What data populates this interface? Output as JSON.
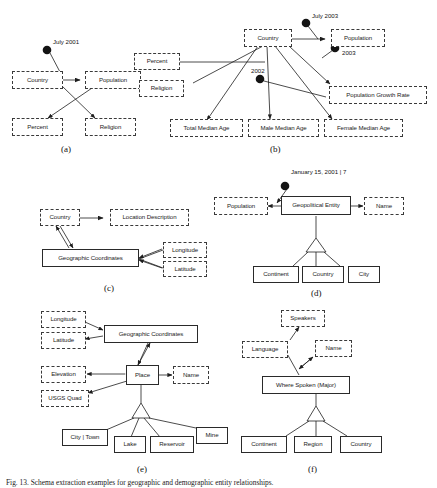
{
  "figure": {
    "caption": "Fig. 13. Schema extraction examples for geographic and demographic entity relationships.",
    "panels": [
      {
        "id": "a",
        "label": "(a)",
        "nodes": [
          {
            "name": "country",
            "text": "Country",
            "style": "dashed"
          },
          {
            "name": "population",
            "text": "Population",
            "style": "dashed"
          },
          {
            "name": "percent",
            "text": "Percent",
            "style": "dashed"
          },
          {
            "name": "religion",
            "text": "Religion",
            "style": "dashed"
          }
        ],
        "annotations": [
          {
            "name": "july-2001",
            "text": "July 2001"
          }
        ]
      },
      {
        "id": "b",
        "label": "(b)",
        "nodes": [
          {
            "name": "country",
            "text": "Country",
            "style": "dashed"
          },
          {
            "name": "population",
            "text": "Population",
            "style": "dashed"
          },
          {
            "name": "percent",
            "text": "Percent",
            "style": "dashed"
          },
          {
            "name": "religion",
            "text": "Religion",
            "style": "dashed"
          },
          {
            "name": "population-growth-rate",
            "text": "Population Growth Rate",
            "style": "dashed"
          },
          {
            "name": "total-median-age",
            "text": "Total Median Age",
            "style": "dashed"
          },
          {
            "name": "male-median-age",
            "text": "Male Median Age",
            "style": "dashed"
          },
          {
            "name": "female-median-age",
            "text": "Female Median Age",
            "style": "dashed"
          }
        ],
        "annotations": [
          {
            "name": "july-2003",
            "text": "July 2003"
          },
          {
            "name": "year-2003",
            "text": "2003"
          },
          {
            "name": "year-2002",
            "text": "2002"
          }
        ]
      },
      {
        "id": "c",
        "label": "(c)",
        "nodes": [
          {
            "name": "country",
            "text": "Country",
            "style": "dashed"
          },
          {
            "name": "location-description",
            "text": "Location Description",
            "style": "dashed"
          },
          {
            "name": "geographic-coordinates",
            "text": "Geographic Coordinates",
            "style": "solid"
          },
          {
            "name": "longitude",
            "text": "Longitude",
            "style": "dashed"
          },
          {
            "name": "latitude",
            "text": "Latitude",
            "style": "dashed"
          }
        ],
        "annotations": []
      },
      {
        "id": "d",
        "label": "(d)",
        "nodes": [
          {
            "name": "population",
            "text": "Population",
            "style": "dashed"
          },
          {
            "name": "geopolitical-entity",
            "text": "Geopolitical Entity",
            "style": "solid"
          },
          {
            "name": "name",
            "text": "Name",
            "style": "dashed"
          },
          {
            "name": "continent",
            "text": "Continent",
            "style": "solid"
          },
          {
            "name": "country",
            "text": "Country",
            "style": "solid"
          },
          {
            "name": "city",
            "text": "City",
            "style": "solid"
          }
        ],
        "annotations": [
          {
            "name": "january-15-2001",
            "text": "January 15, 2001 | 7"
          }
        ]
      },
      {
        "id": "e",
        "label": "(e)",
        "nodes": [
          {
            "name": "longitude",
            "text": "Longitude",
            "style": "dashed"
          },
          {
            "name": "latitude",
            "text": "Latitude",
            "style": "dashed"
          },
          {
            "name": "elevation",
            "text": "Elevation",
            "style": "dashed"
          },
          {
            "name": "usgs-quad",
            "text": "USGS Quad",
            "style": "dashed"
          },
          {
            "name": "geographic-coordinates",
            "text": "Geographic Coordinates",
            "style": "solid"
          },
          {
            "name": "place",
            "text": "Place",
            "style": "solid"
          },
          {
            "name": "name",
            "text": "Name",
            "style": "dashed"
          },
          {
            "name": "city-town",
            "text": "City | Town",
            "style": "solid"
          },
          {
            "name": "lake",
            "text": "Lake",
            "style": "solid"
          },
          {
            "name": "reservoir",
            "text": "Reservoir",
            "style": "solid"
          },
          {
            "name": "mine",
            "text": "Mine",
            "style": "solid"
          }
        ],
        "annotations": []
      },
      {
        "id": "f",
        "label": "(f)",
        "nodes": [
          {
            "name": "speakers",
            "text": "Speakers",
            "style": "dashed"
          },
          {
            "name": "language",
            "text": "Language",
            "style": "dashed"
          },
          {
            "name": "name",
            "text": "Name",
            "style": "dashed"
          },
          {
            "name": "where-spoken-major",
            "text": "Where Spoken (Major)",
            "style": "solid"
          },
          {
            "name": "continent",
            "text": "Continent",
            "style": "solid"
          },
          {
            "name": "region",
            "text": "Region",
            "style": "solid"
          },
          {
            "name": "country",
            "text": "Country",
            "style": "solid"
          }
        ],
        "annotations": []
      }
    ]
  }
}
